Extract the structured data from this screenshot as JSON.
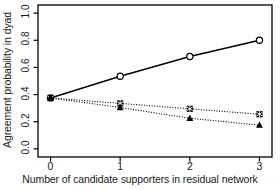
{
  "chart_data": {
    "type": "line",
    "title": "",
    "title_truncated": true,
    "xlabel": "Number of candidate supporters in residual network",
    "ylabel": "Agreement probability in dyad",
    "x": [
      0,
      1,
      2,
      3
    ],
    "xtick_labels": [
      "0",
      "1",
      "2",
      "3"
    ],
    "ytick_labels": [
      "0.0",
      "0.2",
      "0.4",
      "0.6",
      "0.8",
      "1.0"
    ],
    "ytick_values": [
      0.0,
      0.2,
      0.4,
      0.6,
      0.8,
      1.0
    ],
    "xlim": [
      -0.18,
      3.18
    ],
    "ylim": [
      -0.06,
      1.06
    ],
    "grid": false,
    "legend": "none",
    "series": [
      {
        "name": "series-circle-solid",
        "marker": "open-circle",
        "line_style": "solid",
        "color": "#000000",
        "values": [
          0.375,
          0.535,
          0.68,
          0.8
        ]
      },
      {
        "name": "series-square-dotted",
        "marker": "filled-square-asterisk",
        "line_style": "dotted",
        "color": "#000000",
        "values": [
          0.375,
          0.335,
          0.295,
          0.255
        ]
      },
      {
        "name": "series-triangle-dotted",
        "marker": "filled-triangle",
        "line_style": "dotted",
        "color": "#000000",
        "values": [
          0.375,
          0.305,
          0.225,
          0.175
        ]
      }
    ]
  },
  "colors": {
    "ink": "#000000",
    "background": "#ffffff",
    "axis": "#1a1a1a"
  }
}
